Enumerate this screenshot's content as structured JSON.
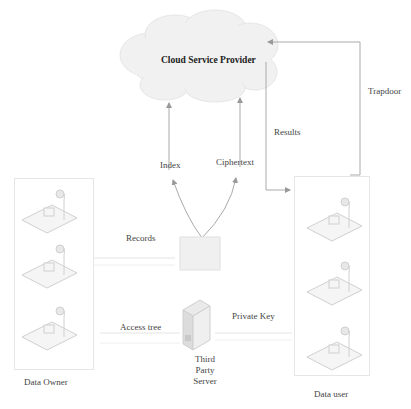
{
  "diagram": {
    "cloud": {
      "label": "Cloud Service Provider"
    },
    "edges": {
      "index": "Index",
      "ciphertext": "Ciphertext",
      "results": "Results",
      "trapdoor": "Trapdoor",
      "records": "Records",
      "access_tree": "Access tree",
      "private_key": "Private Key"
    },
    "nodes": {
      "data_owner": {
        "label": "Data Owner",
        "workstations": 3
      },
      "data_user": {
        "label": "Data user",
        "workstations": 3
      },
      "third_party_server": {
        "line1": "Third",
        "line2": "Party",
        "line3": "Server"
      },
      "records_store": {
        "label": ""
      }
    },
    "colors": {
      "line": "#b5b5b5",
      "cloud": "#f0f0f0",
      "text": "#333333"
    }
  }
}
